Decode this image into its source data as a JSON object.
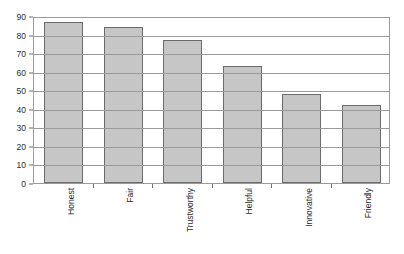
{
  "chart_data": {
    "type": "bar",
    "title": "",
    "subtitle": "",
    "xlabel": "",
    "ylabel": "",
    "categories": [
      "Honest",
      "Fair",
      "Trustworthy",
      "Helpful",
      "Innovative",
      "Friendly"
    ],
    "values": [
      87,
      84,
      77,
      63,
      48,
      42
    ],
    "ylim": [
      0,
      90
    ],
    "ytick_step": 10,
    "yticks": [
      0,
      10,
      20,
      30,
      40,
      50,
      60,
      70,
      80,
      90
    ],
    "ytick_labels": [
      "0",
      "10",
      "20",
      "30",
      "40",
      "50",
      "60",
      "70",
      "80",
      "90"
    ],
    "grid": "horizontal",
    "legend": "none",
    "annotations": [],
    "colors": {
      "bar_fill": "#c6c6c6",
      "bar_border": "#6b6b6b",
      "gridline": "#9a9a9a",
      "axis": "#9a9a9a",
      "text": "#2b2b2b",
      "background": "#ffffff"
    }
  }
}
